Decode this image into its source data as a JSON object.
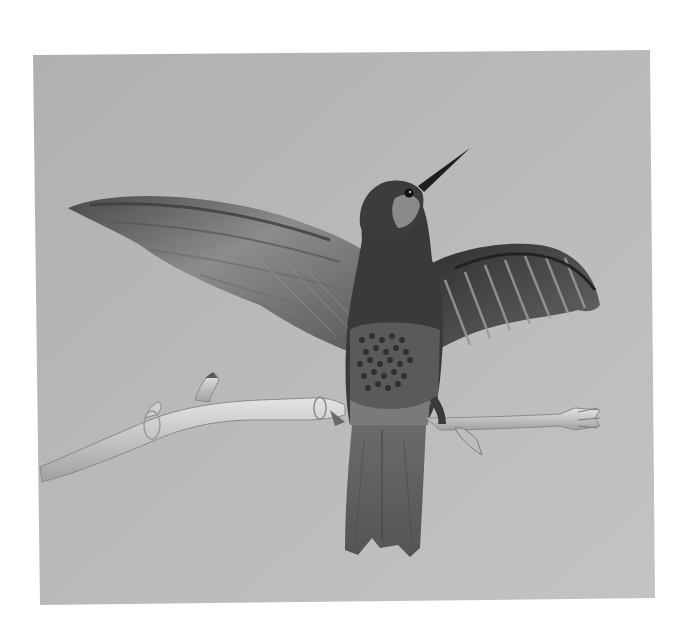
{
  "image": {
    "subject": "Hummingbird with spread wings perched on a bare twig",
    "style": "black-and-white photograph",
    "colors": {
      "page_background": "#ffffff",
      "photo_background": "#b5b5b5",
      "photo_background_light": "#c2c2c2",
      "wing_dark": "#3a3a3a",
      "wing_mid": "#7a7a7a",
      "wing_light": "#a6a6a6",
      "body_dark": "#2a2a2a",
      "branch_light": "#d8d8d8",
      "branch_shadow": "#9a9a9a"
    },
    "photo_frame": {
      "x": 35,
      "y": 52,
      "width": 618,
      "height": 550
    }
  }
}
